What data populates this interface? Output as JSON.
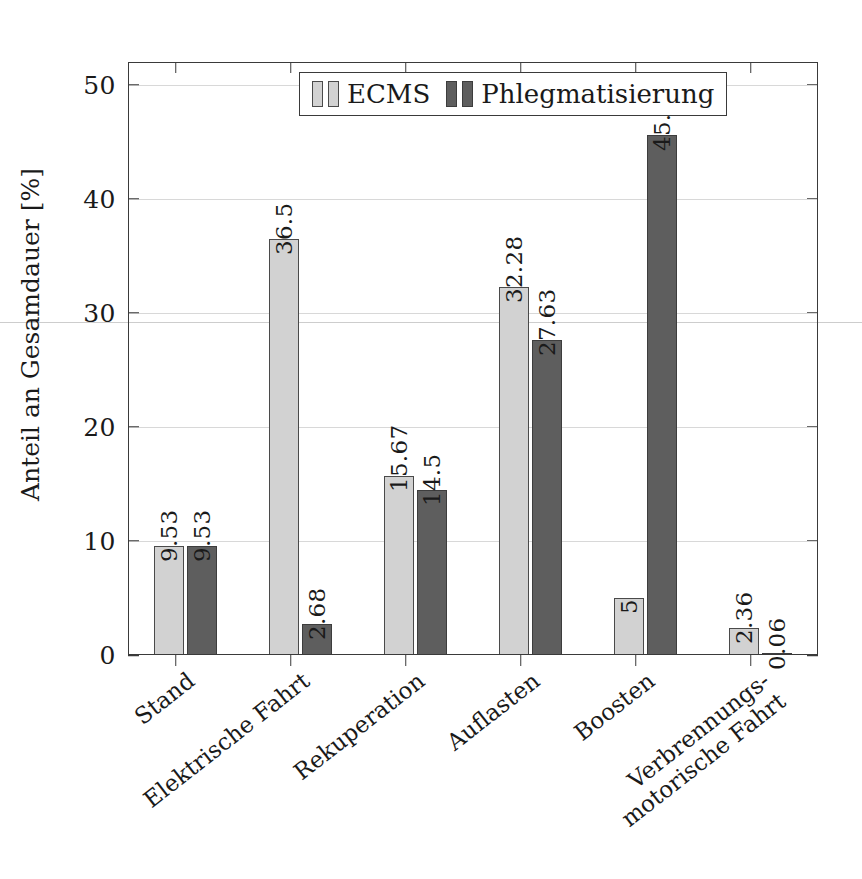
{
  "chart_data": {
    "type": "bar",
    "title": "",
    "xlabel": "",
    "ylabel": "Anteil an Gesamdauer [%]",
    "ylim": [
      0,
      52
    ],
    "yticks": [
      0,
      10,
      20,
      30,
      40,
      50
    ],
    "ytick_labels": [
      "0",
      "10",
      "20",
      "30",
      "40",
      "50"
    ],
    "grid": "horizontal-faint",
    "legend_position": "top-center",
    "categories": [
      "Stand",
      "Elektrische Fahrt",
      "Rekuperation",
      "Auflasten",
      "Boosten",
      "Verbrennungs-\nmotorische Fahrt"
    ],
    "series": [
      {
        "name": "ECMS",
        "color": "#d2d2d2",
        "values": [
          9.53,
          36.5,
          15.67,
          32.28,
          5,
          2.36
        ],
        "labels": [
          "9.53",
          "36.5",
          "15.67",
          "32.28",
          "5",
          "2.36"
        ]
      },
      {
        "name": "Phlegmatisierung",
        "color": "#5e5e5e",
        "values": [
          9.53,
          2.68,
          14.5,
          27.63,
          45.59,
          0.06
        ],
        "labels": [
          "9.53",
          "2.68",
          "14.5",
          "27.63",
          "45.59",
          "0.06"
        ]
      }
    ]
  },
  "legend": {
    "entries": [
      {
        "label": "ECMS"
      },
      {
        "label": "Phlegmatisierung"
      }
    ]
  },
  "axes": {
    "y_title": "Anteil an Gesamdauer [%]"
  }
}
